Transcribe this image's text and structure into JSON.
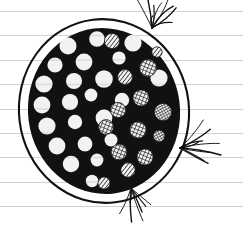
{
  "artwork": {
    "title": "Ink drawing on ruled notebook paper",
    "subject": "stippled dark disc with dotted and cross-hatched cells",
    "medium": "black ink on lined paper",
    "canvas": {
      "width": 243,
      "height": 227
    }
  },
  "palette": {
    "paper": "#ffffff",
    "rule_line": "#c9ccd1",
    "ink": "#111111",
    "ink_soft": "#1a1a1a",
    "cell_fill": "#f2f2f0"
  },
  "paper": {
    "name": "ruled-notebook-paper",
    "line_count": 9,
    "line_spacing": 24.4,
    "line_positions": [
      11,
      35.5,
      60,
      84.5,
      109,
      133,
      157.5,
      182,
      206.5
    ],
    "margin_left": 0,
    "margin_right": 243
  },
  "disc": {
    "name": "stippled-disc",
    "center_x": 104,
    "center_y": 111,
    "outer_ring_rx": 85,
    "outer_ring_ry": 92,
    "outer_ring_stroke": 2.1,
    "body_rx": 76,
    "body_ry": 83,
    "body_fill": "#111111",
    "gap_fill": "#ffffff"
  },
  "cells": {
    "plain_count": 23,
    "hatched_count": 14,
    "plain_label": "white-dot-cell",
    "hatched_label": "hatched-dot-cell",
    "plain": [
      {
        "cx": 68,
        "cy": 46,
        "r": 8.5
      },
      {
        "cx": 97,
        "cy": 39,
        "r": 7.8
      },
      {
        "cx": 133,
        "cy": 43,
        "r": 8.6
      },
      {
        "cx": 55,
        "cy": 65,
        "r": 7.6
      },
      {
        "cx": 84,
        "cy": 62,
        "r": 8.4
      },
      {
        "cx": 119,
        "cy": 58,
        "r": 6.6
      },
      {
        "cx": 44,
        "cy": 84,
        "r": 8.6
      },
      {
        "cx": 74,
        "cy": 81,
        "r": 8.0
      },
      {
        "cx": 104,
        "cy": 79,
        "r": 8.8
      },
      {
        "cx": 159,
        "cy": 78,
        "r": 8.6
      },
      {
        "cx": 42,
        "cy": 105,
        "r": 8.4
      },
      {
        "cx": 70,
        "cy": 102,
        "r": 8.1
      },
      {
        "cx": 91,
        "cy": 95,
        "r": 6.4
      },
      {
        "cx": 122,
        "cy": 100,
        "r": 7.2
      },
      {
        "cx": 47,
        "cy": 126,
        "r": 8.6
      },
      {
        "cx": 75,
        "cy": 122,
        "r": 7.2
      },
      {
        "cx": 104,
        "cy": 118,
        "r": 8.4
      },
      {
        "cx": 57,
        "cy": 146,
        "r": 8.4
      },
      {
        "cx": 85,
        "cy": 144,
        "r": 7.4
      },
      {
        "cx": 111,
        "cy": 140,
        "r": 6.5
      },
      {
        "cx": 71,
        "cy": 164,
        "r": 8.2
      },
      {
        "cx": 97,
        "cy": 160,
        "r": 6.4
      },
      {
        "cx": 92,
        "cy": 181,
        "r": 6.2
      }
    ],
    "hatched": [
      {
        "cx": 112,
        "cy": 41,
        "r": 7.6,
        "style": "diagonal"
      },
      {
        "cx": 148,
        "cy": 68,
        "r": 8.4,
        "style": "cross"
      },
      {
        "cx": 125,
        "cy": 77,
        "r": 7.4,
        "style": "diagonal"
      },
      {
        "cx": 141,
        "cy": 98,
        "r": 8.0,
        "style": "cross"
      },
      {
        "cx": 118,
        "cy": 110,
        "r": 7.6,
        "style": "cross"
      },
      {
        "cx": 163,
        "cy": 112,
        "r": 8.6,
        "style": "radial"
      },
      {
        "cx": 106,
        "cy": 127,
        "r": 7.4,
        "style": "cross"
      },
      {
        "cx": 138,
        "cy": 130,
        "r": 8.2,
        "style": "cross"
      },
      {
        "cx": 159,
        "cy": 136,
        "r": 5.8,
        "style": "radial"
      },
      {
        "cx": 119,
        "cy": 152,
        "r": 7.8,
        "style": "cross"
      },
      {
        "cx": 145,
        "cy": 157,
        "r": 8.0,
        "style": "cross"
      },
      {
        "cx": 128,
        "cy": 170,
        "r": 7.2,
        "style": "diagonal"
      },
      {
        "cx": 104,
        "cy": 183,
        "r": 6.0,
        "style": "diagonal"
      },
      {
        "cx": 157,
        "cy": 52,
        "r": 5.2,
        "style": "diagonal"
      }
    ]
  },
  "tendrils": {
    "name": "wispy-hair-strokes",
    "clusters": [
      {
        "id": "top-right-tuft",
        "origin_x": 152,
        "origin_y": 28,
        "strand_count": 9
      },
      {
        "id": "mid-right-tuft",
        "origin_x": 180,
        "origin_y": 148,
        "strand_count": 9
      },
      {
        "id": "bottom-tuft",
        "origin_x": 131,
        "origin_y": 188,
        "strand_count": 7
      }
    ]
  }
}
